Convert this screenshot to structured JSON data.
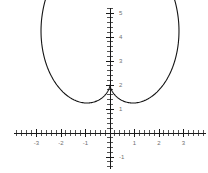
{
  "figure": {
    "title": "",
    "background_color": "#ffffff",
    "width": 208,
    "height": 173
  },
  "axes": {
    "origin_px": {
      "x": 110,
      "y": 133
    },
    "px_per_unit_x": 24.5,
    "px_per_unit_y": 24.0,
    "axis_color": "#1a1a1a",
    "tick_color": "#2b2b2b",
    "label_color": "#707070",
    "minor_tick_step": 0.2,
    "x_axis": {
      "label": "",
      "range": [
        -3.9,
        3.9
      ],
      "tick_labels": [
        "-3",
        "-2",
        "-1",
        "1",
        "2",
        "3"
      ],
      "tick_values": [
        -3,
        -2,
        -1,
        1,
        2,
        3
      ]
    },
    "y_axis": {
      "label": "",
      "range": [
        -1.5,
        5.2
      ],
      "tick_labels": [
        "-1",
        "1",
        "2",
        "3",
        "4",
        "5"
      ],
      "tick_values": [
        -1,
        1,
        2,
        3,
        4,
        5
      ]
    }
  },
  "chart_data": {
    "type": "line",
    "title": "",
    "xlabel": "",
    "ylabel": "",
    "xlim": [
      -3.9,
      3.9
    ],
    "ylim": [
      -1.5,
      5.2
    ],
    "grid": false,
    "legend": false,
    "curve_color": "#151515",
    "series": [
      {
        "name": "cardioid",
        "description": "Closed cardioid-like curve with a cusp at the bottom on the y-axis",
        "polar_form": "r = 2 + 2*sin(theta)",
        "cusp_point": [
          0,
          -1
        ],
        "top_point": [
          0,
          5
        ],
        "leftmost_point": [
          -3.25,
          1.55
        ],
        "rightmost_point": [
          3.25,
          1.55
        ],
        "x": [
          0,
          0.62,
          1.22,
          1.78,
          2.28,
          2.7,
          3.02,
          3.2,
          3.25,
          3.16,
          2.94,
          2.6,
          2.16,
          1.66,
          1.12,
          0.56,
          0,
          -0.56,
          -1.12,
          -1.66,
          -2.16,
          -2.6,
          -2.94,
          -3.16,
          -3.25,
          -3.2,
          -3.02,
          -2.7,
          -2.28,
          -1.78,
          -1.22,
          -0.62,
          0
        ],
        "y": [
          5,
          4.93,
          4.73,
          4.4,
          3.95,
          3.42,
          2.83,
          2.22,
          1.62,
          1.06,
          0.55,
          0.13,
          -0.2,
          -0.45,
          -0.65,
          -0.85,
          -1,
          -0.85,
          -0.65,
          -0.45,
          -0.2,
          0.13,
          0.55,
          1.06,
          1.62,
          2.22,
          2.83,
          3.42,
          3.95,
          4.4,
          4.73,
          4.93,
          5
        ]
      }
    ]
  }
}
